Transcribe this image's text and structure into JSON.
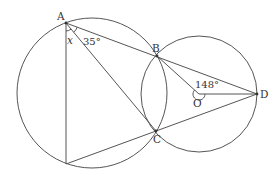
{
  "diagram": {
    "type": "geometry",
    "colors": {
      "stroke": "#555555",
      "text": "#333333",
      "background": "#ffffff"
    },
    "points": {
      "A": {
        "label": "A",
        "x": 66,
        "y": 23
      },
      "B": {
        "label": "B",
        "x": 157,
        "y": 56
      },
      "C": {
        "label": "C",
        "x": 156,
        "y": 131
      },
      "D": {
        "label": "D",
        "x": 257,
        "y": 94
      },
      "O": {
        "label": "O",
        "x": 199,
        "y": 94
      },
      "E": {
        "label": "",
        "x": 66,
        "y": 164
      }
    },
    "circles": [
      {
        "name": "left-circle",
        "cx": 92,
        "cy": 93,
        "r": 75
      },
      {
        "name": "right-circle",
        "cx": 199,
        "cy": 94,
        "r": 58
      }
    ],
    "segments": [
      "A-D",
      "A-C",
      "A-E",
      "E-D",
      "B-O",
      "O-D"
    ],
    "angles": {
      "x": {
        "label": "x",
        "at": "A",
        "between": "AE and AC"
      },
      "bac": {
        "label": "35°",
        "at": "A",
        "between": "AC and AB"
      },
      "bod": {
        "label": "148°",
        "at": "O",
        "between": "OB and OD"
      }
    }
  }
}
